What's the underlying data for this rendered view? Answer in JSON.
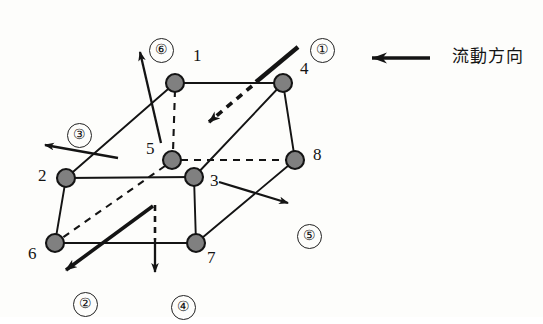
{
  "figure": {
    "background_color": "#fdfdfb",
    "line_color": "#141414",
    "node_fill_color": "#808080",
    "node_stroke_color": "#141414"
  },
  "nodes": [
    {
      "id": "n1",
      "label": "1",
      "x": 175,
      "y": 83,
      "r": 9,
      "label_x": 193,
      "label_y": 56
    },
    {
      "id": "n2",
      "label": "2",
      "x": 66,
      "y": 178,
      "r": 9,
      "label_x": 38,
      "label_y": 176
    },
    {
      "id": "n3",
      "label": "3",
      "x": 194,
      "y": 177,
      "r": 9,
      "label_x": 210,
      "label_y": 180
    },
    {
      "id": "n4",
      "label": "4",
      "x": 283,
      "y": 83,
      "r": 9,
      "label_x": 300,
      "label_y": 68
    },
    {
      "id": "n5",
      "label": "5",
      "x": 172,
      "y": 160,
      "r": 9,
      "label_x": 148,
      "label_y": 148
    },
    {
      "id": "n6",
      "label": "6",
      "x": 55,
      "y": 243,
      "r": 9,
      "label_x": 30,
      "label_y": 252
    },
    {
      "id": "n7",
      "label": "7",
      "x": 196,
      "y": 243,
      "r": 9,
      "label_x": 207,
      "label_y": 256
    },
    {
      "id": "n8",
      "label": "8",
      "x": 295,
      "y": 160,
      "r": 9,
      "label_x": 313,
      "label_y": 153
    }
  ],
  "faces": [
    {
      "id": "f1",
      "label": "①",
      "x": 305,
      "y": 33,
      "description": "face-1-top-right"
    },
    {
      "id": "f2",
      "label": "②",
      "x": 68,
      "y": 287,
      "description": "face-2-bottom-left"
    },
    {
      "id": "f3",
      "label": "③",
      "x": 62,
      "y": 118,
      "description": "face-3-left"
    },
    {
      "id": "f4",
      "label": "④",
      "x": 166,
      "y": 290,
      "description": "face-4-bottom"
    },
    {
      "id": "f5",
      "label": "⑤",
      "x": 292,
      "y": 219,
      "description": "face-5-right"
    },
    {
      "id": "f6",
      "label": "⑥",
      "x": 144,
      "y": 33,
      "description": "face-6-top"
    }
  ],
  "legend": {
    "text": "流動方向",
    "text_x": 452,
    "text_y": 60,
    "arrow": {
      "x1": 430,
      "y1": 58,
      "x2": 368,
      "y2": 58
    }
  },
  "edges": {
    "solid": [
      {
        "from": "n1",
        "to": "n4",
        "name": "edge-1-4"
      },
      {
        "from": "n1",
        "to": "n2",
        "name": "edge-1-2"
      },
      {
        "from": "n4",
        "to": "n8",
        "name": "edge-4-8"
      },
      {
        "from": "n4",
        "to": "n3",
        "name": "edge-4-3"
      },
      {
        "from": "n2",
        "to": "n3",
        "name": "edge-2-3"
      },
      {
        "from": "n2",
        "to": "n6",
        "name": "edge-2-6"
      },
      {
        "from": "n6",
        "to": "n7",
        "name": "edge-6-7"
      },
      {
        "from": "n3",
        "to": "n7",
        "name": "edge-3-7"
      },
      {
        "from": "n7",
        "to": "n8",
        "name": "edge-7-8"
      }
    ],
    "dashed": [
      {
        "from": "n1",
        "to": "n5",
        "name": "edge-1-5-hidden"
      },
      {
        "from": "n5",
        "to": "n8",
        "name": "edge-5-8-hidden"
      },
      {
        "from": "n5",
        "to": "n6",
        "name": "edge-5-6-hidden"
      }
    ]
  },
  "normals": [
    {
      "id": "a1",
      "name": "normal-arrow-1",
      "x1": 298,
      "y1": 47,
      "x2": 204,
      "y2": 126,
      "style": "thick-then-dashed"
    },
    {
      "id": "a2",
      "name": "normal-arrow-2",
      "x1": 153,
      "y1": 206,
      "x2": 62,
      "y2": 273,
      "style": "thick-then-solid"
    },
    {
      "id": "a3",
      "name": "normal-arrow-3",
      "x1": 118,
      "y1": 158,
      "x2": 41,
      "y2": 144,
      "style": "solid"
    },
    {
      "id": "a4",
      "name": "normal-arrow-4",
      "x1": 155,
      "y1": 205,
      "x2": 155,
      "y2": 273,
      "style": "dashed-then-solid"
    },
    {
      "id": "a5",
      "name": "normal-arrow-5",
      "x1": 219,
      "y1": 182,
      "x2": 292,
      "y2": 204,
      "style": "solid"
    },
    {
      "id": "a6",
      "name": "normal-arrow-6",
      "x1": 160,
      "y1": 143,
      "x2": 139,
      "y2": 48,
      "style": "solid"
    }
  ]
}
